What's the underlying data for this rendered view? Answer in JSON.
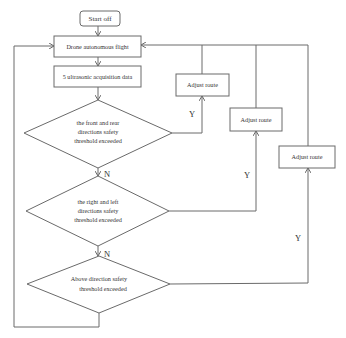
{
  "flowchart": {
    "start": "Start off",
    "flight": "Drone autonomous flight",
    "acquire": "5 ultrasonic acquisition data",
    "decisions": [
      {
        "lines": [
          "the front and rear",
          "directions safety",
          "threshold exceeded"
        ]
      },
      {
        "lines": [
          "the right and left",
          "directions safety",
          "threshold exceeded"
        ]
      },
      {
        "lines": [
          "Above direction safety",
          "threshold exceeded"
        ]
      }
    ],
    "adjust": [
      "Adjust route",
      "Adjust route",
      "Adjust route"
    ],
    "yes_label": "Y",
    "no_label": "N"
  },
  "colors": {
    "line": "#6a6a6a",
    "text": "#333333",
    "background": "#ffffff"
  }
}
